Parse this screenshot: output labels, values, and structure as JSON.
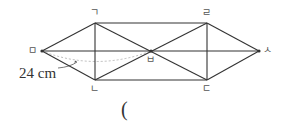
{
  "diagram": {
    "type": "geometry",
    "points": [
      {
        "id": "giyeok",
        "label": "ㄱ",
        "x": 95,
        "y": 23
      },
      {
        "id": "rieul",
        "label": "ㄹ",
        "x": 207,
        "y": 23
      },
      {
        "id": "nieun",
        "label": "ㄴ",
        "x": 95,
        "y": 80
      },
      {
        "id": "digeut",
        "label": "ㄷ",
        "x": 207,
        "y": 80
      },
      {
        "id": "mieum",
        "label": "ㅁ",
        "x": 42,
        "y": 51
      },
      {
        "id": "bieup",
        "label": "ㅂ",
        "x": 151,
        "y": 51
      },
      {
        "id": "siot",
        "label": "ㅅ",
        "x": 259,
        "y": 51
      }
    ],
    "measurement": {
      "label": "24 cm",
      "between": [
        "ㅁ",
        "ㅂ"
      ]
    },
    "line_color": "#333333",
    "dash_color": "#999999"
  },
  "answer": {
    "open_paren": "("
  }
}
